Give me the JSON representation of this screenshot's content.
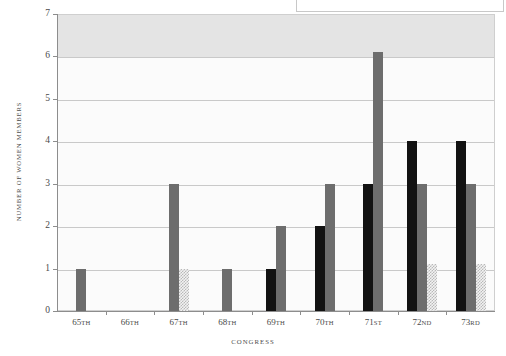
{
  "chart_data": {
    "type": "bar",
    "title": "",
    "subtitle": "",
    "xlabel": "CONGRESS",
    "ylabel": "NUMBER OF WOMEN MEMBERS",
    "categories": [
      "65TH",
      "66TH",
      "67TH",
      "68TH",
      "69TH",
      "70TH",
      "71ST",
      "72ND",
      "73RD"
    ],
    "ylim": [
      0,
      7
    ],
    "yticks": [
      0,
      1,
      2,
      3,
      4,
      5,
      6,
      7
    ],
    "ytick_labels": [
      "0",
      "1",
      "2",
      "3",
      "4",
      "5",
      "6",
      "7"
    ],
    "grid": true,
    "legend": "none",
    "series": [
      {
        "name": "black-series",
        "color": "#121212",
        "values": [
          0,
          0,
          0,
          0,
          1,
          2,
          3,
          4,
          4
        ]
      },
      {
        "name": "gray-series",
        "color": "#6d6d6d",
        "values": [
          1,
          0,
          3,
          1,
          2,
          3,
          6.1,
          3,
          3
        ]
      },
      {
        "name": "hatched-series",
        "color": "#d9d9d9",
        "values": [
          0,
          0,
          1,
          0,
          0,
          0,
          0,
          1.1,
          1.1
        ]
      }
    ]
  },
  "axes": {
    "y_title": "NUMBER OF WOMEN MEMBERS",
    "x_title": "CONGRESS",
    "y_labels": [
      "7",
      "6",
      "5",
      "4",
      "3",
      "2",
      "1",
      "0"
    ],
    "x_labels": [
      {
        "num": "65",
        "suffix": "TH"
      },
      {
        "num": "66",
        "suffix": "TH"
      },
      {
        "num": "67",
        "suffix": "TH"
      },
      {
        "num": "68",
        "suffix": "TH"
      },
      {
        "num": "69",
        "suffix": "TH"
      },
      {
        "num": "70",
        "suffix": "TH"
      },
      {
        "num": "71",
        "suffix": "ST"
      },
      {
        "num": "72",
        "suffix": "ND"
      },
      {
        "num": "73",
        "suffix": "RD"
      }
    ]
  },
  "colors": {
    "black_series": "#121212",
    "gray_series": "#6d6d6d",
    "hatched_series": "#d9d9d9",
    "plot_background": "#fbfbfb",
    "band_background": "#e4e4e4",
    "gridline": "#c9c9c9",
    "axis": "#8d8d8d"
  },
  "legend_box": {
    "label": ""
  }
}
